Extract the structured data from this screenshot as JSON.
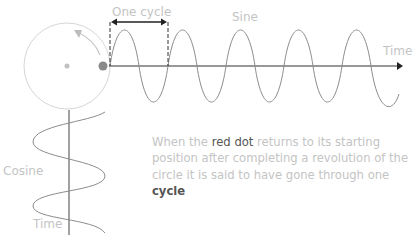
{
  "diagram": {
    "labels": {
      "one_cycle": "One cycle",
      "sine": "Sine",
      "time_horizontal": "Time",
      "cosine": "Cosine",
      "time_vertical": "Time"
    },
    "caption": {
      "part1": "When the ",
      "highlight1": "red dot",
      "part2": " returns to its starting position after completing a revolution of the circle it is said to have gone through one ",
      "highlight2": "cycle"
    },
    "colors": {
      "circle": "#d8d8d8",
      "dot": "#8a8a8a",
      "wave": "#8c8c8c",
      "axis": "#333333",
      "label": "#c4c4c4"
    }
  }
}
